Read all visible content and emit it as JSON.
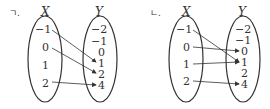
{
  "diagrams": [
    {
      "tag": "ㄱ.",
      "domain_label": "X",
      "codomain_label": "Y",
      "domain": [
        "−1",
        "0",
        "1",
        "2"
      ],
      "codomain": [
        "−2",
        "−1",
        "0",
        "1",
        "2",
        "4"
      ],
      "mappings": [
        {
          "from": "−1",
          "to": "1"
        },
        {
          "from": "0",
          "to": "2"
        },
        {
          "from": "2",
          "to": "4"
        }
      ]
    },
    {
      "tag": "ㄴ.",
      "domain_label": "X",
      "codomain_label": "Y",
      "domain": [
        "−1",
        "0",
        "1",
        "2"
      ],
      "codomain": [
        "−2",
        "−1",
        "0",
        "1",
        "2",
        "4"
      ],
      "mappings": [
        {
          "from": "−1",
          "to": "1"
        },
        {
          "from": "0",
          "to": "0"
        },
        {
          "from": "1",
          "to": "1"
        },
        {
          "from": "2",
          "to": "4"
        }
      ]
    }
  ]
}
